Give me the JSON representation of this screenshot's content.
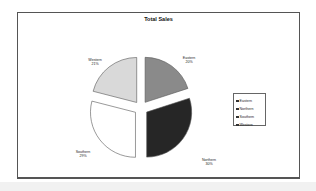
{
  "chart_data": {
    "type": "pie",
    "title": "Total Sales",
    "categories": [
      "Eastern",
      "Northern",
      "Southern",
      "Western"
    ],
    "values": [
      20,
      30,
      29,
      21
    ],
    "unit": "%",
    "exploded": true,
    "start_angle": "12 o'clock, clockwise",
    "legend": {
      "position": "right",
      "entries": [
        "Eastern",
        "Northern",
        "Southern",
        "Western"
      ]
    },
    "colors": {
      "Eastern": "#8a8a8a",
      "Northern": "#262626",
      "Southern": "#ffffff",
      "Western": "#d9d9d9"
    }
  },
  "labels": [
    {
      "name": "Eastern",
      "pct": "20%"
    },
    {
      "name": "Northern",
      "pct": "30%"
    },
    {
      "name": "Southern",
      "pct": "29%"
    },
    {
      "name": "Western",
      "pct": "21%"
    }
  ]
}
